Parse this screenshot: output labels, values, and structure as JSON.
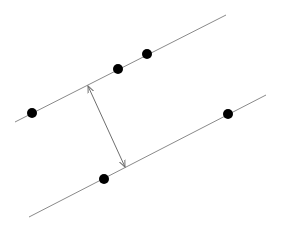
{
  "diagram": {
    "colors": {
      "line": "#8a8a8a",
      "point": "#000000",
      "arrow": "#6e6e6e",
      "background": "#ffffff"
    },
    "lines": [
      {
        "id": "upper-line",
        "x1": 15,
        "y1": 122,
        "x2": 226,
        "y2": 15
      },
      {
        "id": "lower-line",
        "x1": 29,
        "y1": 217,
        "x2": 266,
        "y2": 95
      }
    ],
    "points": [
      {
        "id": "upper-point-1",
        "line": "upper-line",
        "x": 32,
        "y": 113
      },
      {
        "id": "upper-point-2",
        "line": "upper-line",
        "x": 118,
        "y": 69
      },
      {
        "id": "upper-point-3",
        "line": "upper-line",
        "x": 147,
        "y": 54
      },
      {
        "id": "lower-point-1",
        "line": "lower-line",
        "x": 104,
        "y": 179
      },
      {
        "id": "lower-point-2",
        "line": "lower-line",
        "x": 228,
        "y": 114
      }
    ],
    "margin_arrow": {
      "x1": 88,
      "y1": 86,
      "x2": 125,
      "y2": 167,
      "double_headed": true
    },
    "point_radius": 5
  }
}
